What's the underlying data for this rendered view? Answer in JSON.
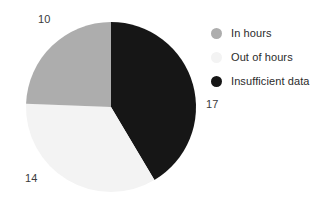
{
  "chart_data": {
    "type": "pie",
    "title": "",
    "categories": [
      "In hours",
      "Out of hours",
      "Insufficient data"
    ],
    "values": [
      10,
      14,
      17
    ],
    "total": 41,
    "data_labels": [
      "10",
      "14",
      "17"
    ],
    "colors": [
      "#ADADAD",
      "#F3F3F3",
      "#161616"
    ],
    "legend_position": "right",
    "grid": false,
    "start_angle_deg": 0,
    "direction": "clockwise",
    "slices": [
      {
        "label": "In hours",
        "value": 10,
        "value_text": "10",
        "color": "#ADADAD",
        "percent": 24.4
      },
      {
        "label": "Out of hours",
        "value": 14,
        "value_text": "14",
        "color": "#F3F3F3",
        "percent": 34.1
      },
      {
        "label": "Insufficient data",
        "value": 17,
        "value_text": "17",
        "color": "#161616",
        "percent": 41.5
      }
    ]
  },
  "legend": {
    "items": [
      {
        "label": "In hours",
        "color": "#ADADAD",
        "marker": "circle-marker"
      },
      {
        "label": "Out of hours",
        "color": "#F3F3F3",
        "marker": "circle-marker"
      },
      {
        "label": "Insufficient data",
        "color": "#161616",
        "marker": "circle-marker"
      }
    ]
  },
  "labels": {
    "in_hours_value": "10",
    "out_of_hours_value": "14",
    "insufficient_data_value": "17"
  }
}
